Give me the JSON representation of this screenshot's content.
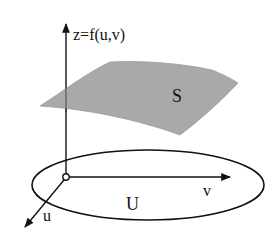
{
  "diagram": {
    "labels": {
      "z_axis": "z=f(u,v)",
      "surface": "S",
      "domain": "U",
      "u_axis": "u",
      "v_axis": "v"
    },
    "colors": {
      "surface_fill": "#a9a9a9",
      "stroke": "#111111",
      "background": "#ffffff"
    },
    "elements": [
      {
        "type": "axis",
        "name": "z",
        "from": [
          66,
          177
        ],
        "to": [
          66,
          22
        ]
      },
      {
        "type": "axis",
        "name": "v",
        "from": [
          66,
          177
        ],
        "to": [
          232,
          177
        ]
      },
      {
        "type": "axis",
        "name": "u",
        "from": [
          66,
          177
        ],
        "to": [
          24,
          228
        ]
      },
      {
        "type": "ellipse",
        "name": "U",
        "cx": 148,
        "cy": 185,
        "rx": 116,
        "ry": 35
      },
      {
        "type": "surface",
        "name": "S"
      }
    ]
  }
}
